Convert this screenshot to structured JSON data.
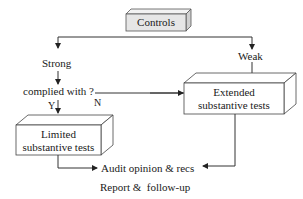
{
  "diagram": {
    "type": "flowchart",
    "nodes": {
      "controls": {
        "label": "Controls"
      },
      "strong": {
        "label": "Strong"
      },
      "weak": {
        "label": "Weak"
      },
      "complied": {
        "label": "complied with ?"
      },
      "yes": {
        "label": "Y"
      },
      "no": {
        "label": "N"
      },
      "limited": {
        "line1": "Limited",
        "line2": "substantive tests"
      },
      "extended": {
        "line1": "Extended",
        "line2": "substantive tests"
      },
      "audit": {
        "label": "Audit opinion & recs"
      },
      "report": {
        "label": "Report &  follow-up"
      }
    },
    "edges": [
      {
        "from": "controls",
        "to": "strong"
      },
      {
        "from": "controls",
        "to": "weak"
      },
      {
        "from": "strong",
        "to": "complied"
      },
      {
        "from": "complied",
        "to": "limited",
        "label": "Y"
      },
      {
        "from": "complied",
        "to": "extended",
        "label": "N"
      },
      {
        "from": "weak",
        "to": "extended"
      },
      {
        "from": "limited",
        "to": "audit"
      },
      {
        "from": "extended",
        "to": "audit"
      }
    ],
    "colors": {
      "controls_fill": "#e6e6e6",
      "box_fill": "#ffffff",
      "stroke": "#333333"
    }
  }
}
